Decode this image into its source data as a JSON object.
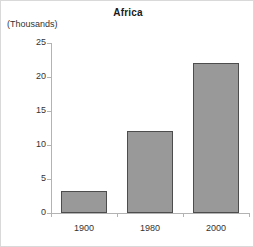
{
  "chart_data": {
    "type": "bar",
    "title": "Africa",
    "xlabel": "",
    "ylabel": "(Thousands)",
    "categories": [
      "1900",
      "1980",
      "2000"
    ],
    "values": [
      3.3,
      12,
      22
    ],
    "ylim": [
      0,
      25
    ],
    "yticks": [
      0,
      5,
      10,
      15,
      20,
      25
    ],
    "ytick_labels": [
      "0",
      "5",
      "10",
      "15",
      "20",
      "25"
    ],
    "grid": false,
    "legend": null,
    "series": [
      {
        "name": "Africa",
        "values": [
          3.3,
          12,
          22
        ]
      }
    ],
    "colors": {
      "bar_fill": "#999999",
      "bar_border": "#4d4d4d",
      "axis": "#b3b3b3",
      "text": "#333333",
      "title": "#1a1a1a",
      "background": "#ffffff",
      "frame": "#d9d9d9"
    }
  }
}
